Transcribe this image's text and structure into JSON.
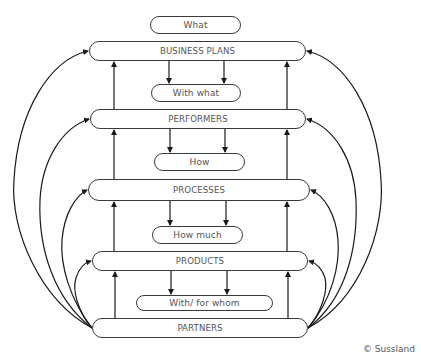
{
  "diagram": {
    "title": "",
    "nodes": {
      "what": {
        "label": "What",
        "type": "question"
      },
      "business_plans": {
        "label": "BUSINESS PLANS",
        "type": "level"
      },
      "with_what": {
        "label": "With what",
        "type": "question"
      },
      "performers": {
        "label": "PERFORMERS",
        "type": "level"
      },
      "how": {
        "label": "How",
        "type": "question"
      },
      "processes": {
        "label": "PROCESSES",
        "type": "level"
      },
      "how_much": {
        "label": "How much",
        "type": "question"
      },
      "products": {
        "label": "PRODUCTS",
        "type": "level"
      },
      "with_for_whom": {
        "label": "With/ for whom",
        "type": "question"
      },
      "partners": {
        "label": "PARTNERS",
        "type": "level"
      }
    },
    "edges": [
      {
        "from": "business_plans",
        "to": "with_what",
        "count": 2,
        "direction": "down"
      },
      {
        "from": "performers",
        "to": "how",
        "count": 2,
        "direction": "down"
      },
      {
        "from": "processes",
        "to": "how_much",
        "count": 2,
        "direction": "down"
      },
      {
        "from": "products",
        "to": "with_for_whom",
        "count": 2,
        "direction": "down"
      },
      {
        "from": "performers",
        "to": "business_plans",
        "count": 2,
        "direction": "up"
      },
      {
        "from": "processes",
        "to": "performers",
        "count": 2,
        "direction": "up"
      },
      {
        "from": "products",
        "to": "processes",
        "count": 2,
        "direction": "up"
      },
      {
        "from": "partners",
        "to": "products",
        "count": 2,
        "direction": "up"
      },
      {
        "from": "partners",
        "to": "business_plans",
        "style": "curved",
        "sides": [
          "left",
          "right"
        ]
      },
      {
        "from": "partners",
        "to": "performers",
        "style": "curved",
        "sides": [
          "left",
          "right"
        ]
      },
      {
        "from": "partners",
        "to": "processes",
        "style": "curved",
        "sides": [
          "left",
          "right"
        ]
      },
      {
        "from": "partners",
        "to": "products",
        "style": "curved",
        "sides": [
          "left",
          "right"
        ]
      }
    ],
    "colors": {
      "stroke": "#1a1a1a",
      "box_border": "#3a3a3a",
      "text": "#555555",
      "background": "#ffffff"
    }
  },
  "footer": {
    "copyright": "© Sussland"
  }
}
